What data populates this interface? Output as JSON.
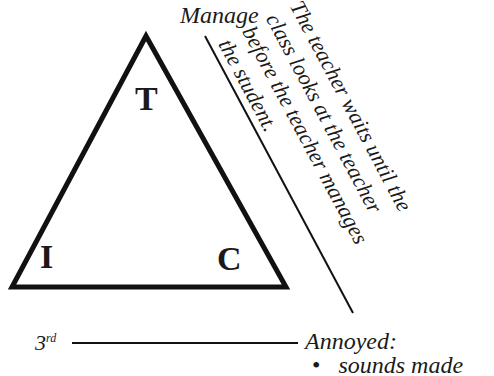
{
  "diagram": {
    "top_label": "Manage",
    "vertices": {
      "top": "T",
      "left": "I",
      "right": "C"
    },
    "note_lines": [
      "The teacher waits until the",
      "class looks at the teacher",
      "before the teacher manages",
      "the student."
    ],
    "level_label": "3",
    "level_suffix": "rd",
    "outcome_label": "Annoyed:",
    "outcome_items": [
      "sounds made"
    ]
  }
}
